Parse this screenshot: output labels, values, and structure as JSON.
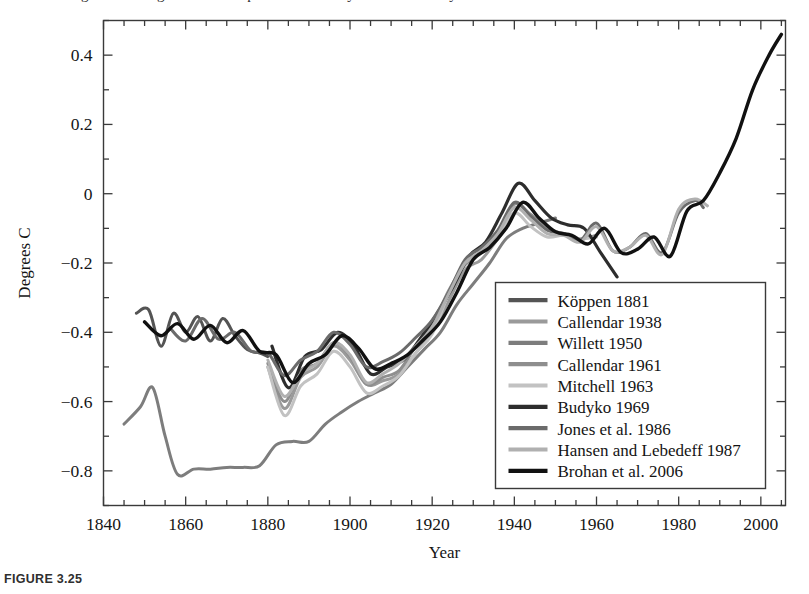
{
  "figure": {
    "caption": "FIGURE 3.25",
    "cut_header_text": "Estimates of global average surface temperature anomaly from nine analyses"
  },
  "chart_data": {
    "type": "line",
    "title": "",
    "xlabel": "Year",
    "ylabel": "Degrees C",
    "xlim": [
      1840,
      2006
    ],
    "ylim": [
      -0.9,
      0.5
    ],
    "xticks": [
      1840,
      1860,
      1880,
      1900,
      1920,
      1940,
      1960,
      1980,
      2000
    ],
    "xtick_labels": [
      "1840",
      "1860",
      "1880",
      "1900",
      "1920",
      "1940",
      "1960",
      "1980",
      "2000"
    ],
    "x_minor_interval": 5,
    "yticks": [
      0.4,
      0.2,
      0,
      -0.2,
      -0.4,
      -0.6,
      -0.8
    ],
    "ytick_labels": [
      "0.4",
      "0.2",
      "0",
      "-0.2",
      "-0.4",
      "-0.6",
      "-0.8"
    ],
    "y_minor_interval": 0.1,
    "grid": false,
    "legend_position": "lower-right-inside",
    "series": [
      {
        "name": "Köppen 1881",
        "color": "#545454",
        "width": 3.0,
        "x": [
          1848,
          1851,
          1854,
          1857,
          1860,
          1863,
          1866,
          1869,
          1872,
          1875,
          1878,
          1880
        ],
        "y": [
          -0.345,
          -0.335,
          -0.44,
          -0.345,
          -0.4,
          -0.355,
          -0.425,
          -0.36,
          -0.41,
          -0.45,
          -0.46,
          -0.47
        ]
      },
      {
        "name": "Callendar 1938",
        "color": "#9a9a9a",
        "width": 3.0,
        "x": [
          1880,
          1884,
          1888,
          1892,
          1896,
          1900,
          1904,
          1908,
          1912,
          1916,
          1920,
          1924,
          1928,
          1932,
          1936,
          1938
        ],
        "y": [
          -0.5,
          -0.62,
          -0.53,
          -0.5,
          -0.44,
          -0.48,
          -0.55,
          -0.54,
          -0.52,
          -0.46,
          -0.4,
          -0.31,
          -0.22,
          -0.19,
          -0.13,
          -0.1
        ]
      },
      {
        "name": "Willett 1950",
        "color": "#7d7d7d",
        "width": 3.0,
        "x": [
          1845,
          1849,
          1852,
          1855,
          1858,
          1862,
          1866,
          1870,
          1874,
          1878,
          1882,
          1886,
          1890,
          1894,
          1898,
          1902,
          1906,
          1910,
          1914,
          1918,
          1922,
          1926,
          1930,
          1934,
          1938,
          1942,
          1946,
          1950
        ],
        "y": [
          -0.665,
          -0.615,
          -0.56,
          -0.7,
          -0.81,
          -0.795,
          -0.795,
          -0.79,
          -0.79,
          -0.785,
          -0.725,
          -0.715,
          -0.715,
          -0.665,
          -0.63,
          -0.6,
          -0.575,
          -0.55,
          -0.5,
          -0.45,
          -0.4,
          -0.32,
          -0.26,
          -0.2,
          -0.13,
          -0.1,
          -0.085,
          -0.07
        ]
      },
      {
        "name": "Callendar 1961",
        "color": "#8e8e8e",
        "width": 3.0,
        "x": [
          1880,
          1884,
          1888,
          1892,
          1896,
          1900,
          1904,
          1908,
          1912,
          1916,
          1920,
          1924,
          1928,
          1932,
          1936,
          1940,
          1944,
          1948,
          1952,
          1956,
          1960
        ],
        "y": [
          -0.49,
          -0.6,
          -0.51,
          -0.49,
          -0.43,
          -0.47,
          -0.55,
          -0.53,
          -0.51,
          -0.44,
          -0.38,
          -0.28,
          -0.205,
          -0.17,
          -0.11,
          -0.03,
          -0.06,
          -0.1,
          -0.115,
          -0.13,
          -0.12
        ]
      },
      {
        "name": "Mitchell 1963",
        "color": "#c2c2c2",
        "width": 3.0,
        "x": [
          1880,
          1884,
          1888,
          1892,
          1896,
          1900,
          1904,
          1908,
          1912,
          1916,
          1920,
          1924,
          1928,
          1932,
          1936,
          1940,
          1944,
          1948,
          1952,
          1956,
          1960
        ],
        "y": [
          -0.5,
          -0.64,
          -0.555,
          -0.52,
          -0.455,
          -0.5,
          -0.575,
          -0.555,
          -0.525,
          -0.46,
          -0.405,
          -0.29,
          -0.2,
          -0.165,
          -0.12,
          -0.055,
          -0.095,
          -0.125,
          -0.12,
          -0.13,
          -0.125
        ]
      },
      {
        "name": "Budyko 1969",
        "color": "#2d2d2d",
        "width": 3.2,
        "x": [
          1881,
          1885,
          1889,
          1893,
          1897,
          1901,
          1905,
          1909,
          1913,
          1917,
          1921,
          1925,
          1929,
          1933,
          1937,
          1941,
          1945,
          1949,
          1953,
          1957,
          1961,
          1965
        ],
        "y": [
          -0.44,
          -0.56,
          -0.47,
          -0.45,
          -0.4,
          -0.44,
          -0.52,
          -0.5,
          -0.48,
          -0.42,
          -0.35,
          -0.27,
          -0.18,
          -0.14,
          -0.055,
          0.03,
          -0.02,
          -0.07,
          -0.09,
          -0.1,
          -0.17,
          -0.24
        ]
      },
      {
        "name": "Jones et al. 1986",
        "color": "#6b6b6b",
        "width": 3.0,
        "x": [
          1856,
          1860,
          1864,
          1868,
          1872,
          1876,
          1880,
          1884,
          1888,
          1892,
          1896,
          1900,
          1904,
          1908,
          1912,
          1916,
          1920,
          1924,
          1928,
          1932,
          1936,
          1940,
          1944,
          1948,
          1952,
          1956,
          1960,
          1964,
          1968,
          1972,
          1976,
          1980,
          1984,
          1986
        ],
        "y": [
          -0.385,
          -0.425,
          -0.36,
          -0.42,
          -0.4,
          -0.455,
          -0.46,
          -0.525,
          -0.48,
          -0.455,
          -0.4,
          -0.435,
          -0.5,
          -0.485,
          -0.46,
          -0.415,
          -0.365,
          -0.285,
          -0.19,
          -0.155,
          -0.105,
          -0.025,
          -0.065,
          -0.105,
          -0.115,
          -0.135,
          -0.085,
          -0.165,
          -0.155,
          -0.115,
          -0.17,
          -0.055,
          -0.02,
          -0.04
        ]
      },
      {
        "name": "Hansen and Lebedeff 1987",
        "color": "#b0b0b0",
        "width": 3.0,
        "x": [
          1880,
          1884,
          1888,
          1892,
          1896,
          1900,
          1904,
          1908,
          1912,
          1916,
          1920,
          1924,
          1928,
          1932,
          1936,
          1940,
          1944,
          1948,
          1952,
          1956,
          1960,
          1964,
          1968,
          1972,
          1976,
          1980,
          1984,
          1987
        ],
        "y": [
          -0.48,
          -0.585,
          -0.52,
          -0.49,
          -0.43,
          -0.465,
          -0.545,
          -0.52,
          -0.49,
          -0.44,
          -0.385,
          -0.29,
          -0.2,
          -0.165,
          -0.115,
          -0.04,
          -0.075,
          -0.115,
          -0.12,
          -0.14,
          -0.095,
          -0.165,
          -0.155,
          -0.12,
          -0.175,
          -0.045,
          -0.015,
          -0.035
        ]
      },
      {
        "name": "Brohan et al. 2006",
        "color": "#111111",
        "width": 3.4,
        "x": [
          1850,
          1854,
          1858,
          1862,
          1866,
          1870,
          1874,
          1878,
          1882,
          1886,
          1890,
          1894,
          1898,
          1902,
          1906,
          1910,
          1914,
          1918,
          1922,
          1926,
          1930,
          1934,
          1938,
          1942,
          1946,
          1950,
          1954,
          1958,
          1962,
          1966,
          1970,
          1974,
          1978,
          1982,
          1986,
          1990,
          1994,
          1998,
          2002,
          2005
        ],
        "y": [
          -0.37,
          -0.41,
          -0.375,
          -0.42,
          -0.38,
          -0.43,
          -0.395,
          -0.455,
          -0.465,
          -0.545,
          -0.49,
          -0.465,
          -0.41,
          -0.445,
          -0.505,
          -0.49,
          -0.465,
          -0.42,
          -0.37,
          -0.285,
          -0.19,
          -0.155,
          -0.1,
          -0.025,
          -0.07,
          -0.11,
          -0.12,
          -0.145,
          -0.1,
          -0.17,
          -0.16,
          -0.125,
          -0.18,
          -0.05,
          -0.02,
          0.06,
          0.16,
          0.3,
          0.4,
          0.46
        ]
      }
    ]
  },
  "legend": {
    "entries": [
      {
        "label": "Köppen 1881",
        "color": "#545454"
      },
      {
        "label": "Callendar 1938",
        "color": "#9a9a9a"
      },
      {
        "label": "Willett 1950",
        "color": "#7d7d7d"
      },
      {
        "label": "Callendar 1961",
        "color": "#8e8e8e"
      },
      {
        "label": "Mitchell 1963",
        "color": "#c2c2c2"
      },
      {
        "label": "Budyko 1969",
        "color": "#2d2d2d"
      },
      {
        "label": "Jones et al. 1986",
        "color": "#6b6b6b"
      },
      {
        "label": "Hansen and Lebedeff 1987",
        "color": "#b0b0b0"
      },
      {
        "label": "Brohan et al. 2006",
        "color": "#111111"
      }
    ]
  }
}
